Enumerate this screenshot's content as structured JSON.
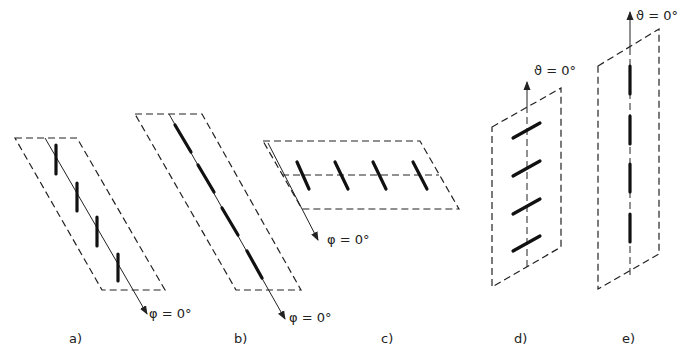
{
  "figures": [
    {
      "id": "a",
      "caption": "a)",
      "angle_label": "φ = 0°",
      "elements": 4
    },
    {
      "id": "b",
      "caption": "b)",
      "angle_label": "φ = 0°",
      "elements": 4
    },
    {
      "id": "c",
      "caption": "c)",
      "angle_label": "φ = 0°",
      "elements": 4
    },
    {
      "id": "d",
      "caption": "d)",
      "angle_label": "ϑ = 0°",
      "elements": 4
    },
    {
      "id": "e",
      "caption": "e)",
      "angle_label": "ϑ = 0°",
      "elements": 4
    }
  ]
}
